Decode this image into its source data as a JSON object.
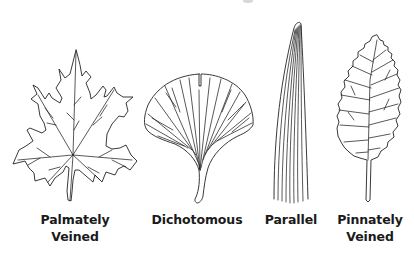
{
  "diagram": {
    "type": "leaf-venation-types",
    "leaves": [
      {
        "id": "palmately-veined",
        "label_lines": [
          "Palmately",
          "Veined"
        ],
        "shape": "maple"
      },
      {
        "id": "dichotomous",
        "label_lines": [
          "Dichotomous"
        ],
        "shape": "ginkgo"
      },
      {
        "id": "parallel",
        "label_lines": [
          "Parallel"
        ],
        "shape": "grass-blade"
      },
      {
        "id": "pinnately-veined",
        "label_lines": [
          "Pinnately",
          "Veined"
        ],
        "shape": "serrated-ovate"
      }
    ],
    "colors": {
      "line": "#222222",
      "text": "#1a1a1a",
      "background": "#ffffff"
    }
  }
}
